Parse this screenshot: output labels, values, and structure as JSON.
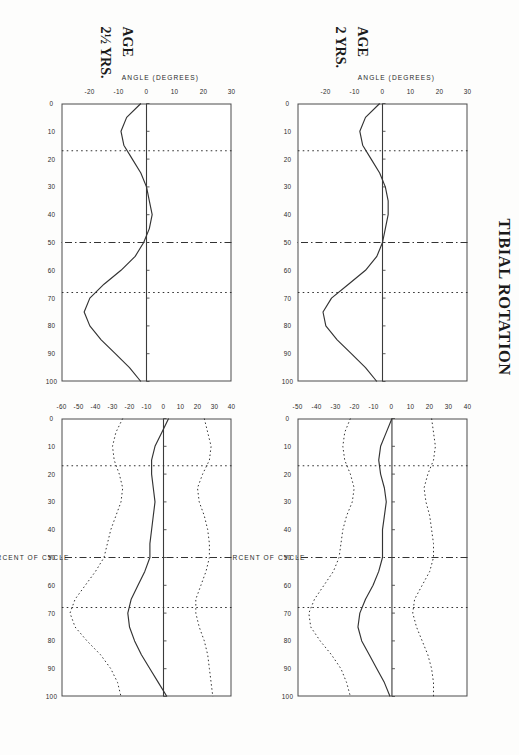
{
  "figure": {
    "title": "TIBIAL ROTATION",
    "xlabel": "PERCENT OF CYCLE",
    "ylabel": "ANGLE  (DEGREES)"
  },
  "rows": [
    {
      "age_label": "AGE",
      "age_value": "2 YRS."
    },
    {
      "age_label": "AGE",
      "age_value": "2½ YRS."
    }
  ],
  "xticks": [
    "0",
    "10",
    "20",
    "30",
    "40",
    "50",
    "60",
    "70",
    "80",
    "90",
    "100"
  ],
  "left_yticks": [
    "30",
    "20",
    "10",
    "0",
    "-10",
    "-20"
  ],
  "right_yticks": [
    "40",
    "30",
    "20",
    "10",
    "0",
    "-10",
    "-20",
    "-30",
    "-40",
    "-50"
  ],
  "chart_data": {
    "type": "line",
    "title": "TIBIAL ROTATION",
    "xlabel": "PERCENT OF CYCLE",
    "ylabel": "ANGLE  (DEGREES)",
    "grid": false,
    "legend": "none",
    "x": [
      0,
      5,
      10,
      15,
      20,
      25,
      30,
      35,
      40,
      45,
      50,
      55,
      60,
      65,
      70,
      75,
      80,
      85,
      90,
      95,
      100
    ],
    "event_markers": [
      {
        "x": 17,
        "style": "dotted",
        "label": "opposite toe off"
      },
      {
        "x": 50,
        "style": "dash-dot",
        "label": "opposite foot contact"
      },
      {
        "x": 68,
        "style": "dotted",
        "label": "toe off"
      }
    ],
    "panels": [
      {
        "row": "2 YRS.",
        "column": "individual",
        "ylim": [
          -30,
          30
        ],
        "yticks": [
          30,
          20,
          10,
          0,
          -10,
          -20
        ],
        "xlim": [
          0,
          100
        ],
        "series": [
          {
            "name": "mean",
            "style": "solid",
            "values": [
              -1,
              -6,
              -8,
              -7,
              -4,
              -1,
              1,
              2,
              2,
              1,
              0,
              -2,
              -6,
              -12,
              -18,
              -21,
              -20,
              -16,
              -11,
              -6,
              -2
            ]
          }
        ]
      },
      {
        "row": "2 YRS.",
        "column": "normal band",
        "ylim": [
          -50,
          40
        ],
        "yticks": [
          40,
          30,
          20,
          10,
          0,
          -10,
          -20,
          -30,
          -40,
          -50
        ],
        "xlim": [
          0,
          100
        ],
        "series": [
          {
            "name": "mean",
            "style": "solid",
            "values": [
              0,
              -3,
              -6,
              -7,
              -6,
              -4,
              -3,
              -4,
              -5,
              -5,
              -5,
              -7,
              -10,
              -14,
              -17,
              -18,
              -16,
              -12,
              -8,
              -4,
              -1
            ]
          },
          {
            "name": "+1 SD",
            "style": "dotted",
            "values": [
              21,
              22,
              23,
              22,
              19,
              17,
              18,
              20,
              21,
              22,
              22,
              20,
              16,
              12,
              11,
              13,
              16,
              19,
              21,
              22,
              22
            ]
          },
          {
            "name": "-1 SD",
            "style": "dotted",
            "values": [
              -22,
              -25,
              -26,
              -25,
              -22,
              -20,
              -21,
              -24,
              -26,
              -27,
              -28,
              -31,
              -36,
              -41,
              -44,
              -43,
              -38,
              -32,
              -27,
              -24,
              -22
            ]
          }
        ]
      },
      {
        "row": "2½ YRS.",
        "column": "individual",
        "ylim": [
          -30,
          30
        ],
        "yticks": [
          30,
          20,
          10,
          0,
          -10,
          -20
        ],
        "xlim": [
          0,
          100
        ],
        "series": [
          {
            "name": "mean",
            "style": "solid",
            "values": [
              -2,
              -7,
              -9,
              -8,
              -5,
              -2,
              0,
              1,
              2,
              1,
              -1,
              -4,
              -9,
              -15,
              -20,
              -22,
              -20,
              -16,
              -11,
              -6,
              -2
            ]
          }
        ]
      },
      {
        "row": "2½ YRS.",
        "column": "normal band",
        "ylim": [
          -60,
          40
        ],
        "yticks": [
          40,
          30,
          20,
          10,
          0,
          -10,
          -20,
          -30,
          -40,
          -50,
          -60
        ],
        "xlim": [
          0,
          100
        ],
        "series": [
          {
            "name": "mean",
            "style": "solid",
            "values": [
              3,
              -1,
              -5,
              -7,
              -7,
              -6,
              -5,
              -6,
              -7,
              -8,
              -8,
              -11,
              -15,
              -19,
              -21,
              -20,
              -17,
              -13,
              -8,
              -3,
              2
            ]
          },
          {
            "name": "+1 SD",
            "style": "dotted",
            "values": [
              24,
              26,
              28,
              27,
              23,
              20,
              21,
              24,
              26,
              27,
              27,
              25,
              22,
              19,
              19,
              21,
              24,
              26,
              27,
              28,
              29
            ]
          },
          {
            "name": "-1 SD",
            "style": "dotted",
            "values": [
              -24,
              -28,
              -30,
              -29,
              -26,
              -24,
              -25,
              -28,
              -31,
              -33,
              -35,
              -40,
              -46,
              -52,
              -55,
              -52,
              -45,
              -37,
              -31,
              -27,
              -25
            ]
          }
        ]
      }
    ]
  }
}
